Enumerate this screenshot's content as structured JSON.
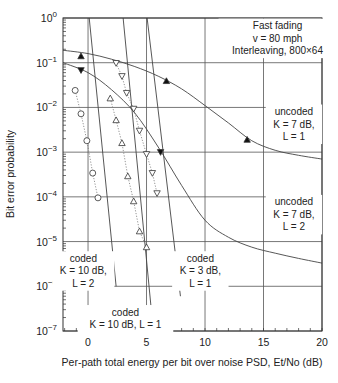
{
  "chart_data": {
    "type": "line",
    "title": "",
    "xlabel": "Per-path total energy per bit over noise PSD, Et/No (dB)",
    "ylabel": "Bit error probability",
    "xlim": [
      -2.14,
      20
    ],
    "ylim": [
      1e-07,
      1
    ],
    "yscale": "log",
    "grid": true,
    "x_ticks": [
      0,
      5,
      10,
      15,
      20
    ],
    "x_tick_labels": [
      "0",
      "5",
      "10",
      "15",
      "20"
    ],
    "y_ticks": [
      1,
      0.1,
      0.01,
      0.001,
      0.0001,
      1e-05,
      1e-06,
      1e-07
    ],
    "y_tick_labels": [
      {
        "base": "10",
        "exp": "0"
      },
      {
        "base": "10",
        "exp": "−1"
      },
      {
        "base": "10",
        "exp": "−2"
      },
      {
        "base": "10",
        "exp": "−3"
      },
      {
        "base": "10",
        "exp": "−4"
      },
      {
        "base": "10",
        "exp": "−5"
      },
      {
        "base": "10",
        "exp": "−6"
      },
      {
        "base": "10",
        "exp": "−7"
      }
    ],
    "annotations": [
      {
        "lines": [
          "Fast fading",
          "v = 80 mph",
          "Interleaving, 800×64"
        ],
        "x": 16.2,
        "y": 0.35
      },
      {
        "lines": [
          "uncoded",
          "K = 7 dB,",
          "L = 1"
        ],
        "x": 17.6,
        "y": 0.0042
      },
      {
        "lines": [
          "uncoded",
          "K = 7 dB,",
          "L = 2"
        ],
        "x": 17.6,
        "y": 4e-05
      },
      {
        "lines": [
          "coded",
          "K = 10 dB,",
          "L = 2"
        ],
        "x": -0.4,
        "y": 2.2e-06
      },
      {
        "lines": [
          "coded",
          "K = 10 dB, L = 1"
        ],
        "x": 3.2,
        "y": 1.9e-07
      },
      {
        "lines": [
          "coded",
          "K = 3 dB,",
          "L = 1"
        ],
        "x": 9.6,
        "y": 2.2e-06
      }
    ],
    "series": [
      {
        "name": "uncoded K = 7 dB, L = 1 (theory)",
        "style": "solid",
        "x": [
          -2.14,
          0,
          2,
          4,
          6,
          8,
          10,
          12,
          14,
          16,
          18,
          20
        ],
        "values": [
          0.19,
          0.16,
          0.12,
          0.082,
          0.05,
          0.026,
          0.011,
          0.0045,
          0.0018,
          0.0011,
          0.00085,
          0.0007
        ]
      },
      {
        "name": "uncoded K = 7 dB, L = 1 (simulation)",
        "style": "markers",
        "marker": "triangle-up-filled",
        "x": [
          -0.6,
          6.7,
          13.6
        ],
        "values": [
          0.14,
          0.039,
          0.0019
        ]
      },
      {
        "name": "uncoded K = 7 dB, L = 2 (theory)",
        "style": "solid",
        "x": [
          -2.14,
          0,
          2,
          4,
          6,
          8,
          10,
          12,
          14,
          16,
          18,
          20
        ],
        "values": [
          0.1,
          0.06,
          0.025,
          0.0075,
          0.0013,
          0.00018,
          3e-05,
          1.25e-05,
          7.5e-06,
          5.5e-06,
          4.2e-06,
          3.3e-06
        ]
      },
      {
        "name": "uncoded K = 7 dB, L = 2 (simulation)",
        "style": "markers",
        "marker": "triangle-down-filled",
        "x": [
          -0.6,
          6.2
        ],
        "values": [
          0.068,
          0.001
        ]
      },
      {
        "name": "coded K = 10 dB, L = 2 (theory)",
        "style": "solid",
        "x": [
          0.1,
          2.4
        ],
        "values": [
          1,
          1e-06
        ]
      },
      {
        "name": "coded K = 10 dB, L = 2 (simulation)",
        "style": "dotted-markers",
        "marker": "circle-open",
        "x": [
          -1.1,
          -0.6,
          -0.1,
          0.4,
          0.85
        ],
        "values": [
          0.024,
          0.0072,
          0.0018,
          0.00034,
          9.5e-05
        ]
      },
      {
        "name": "coded K = 10 dB, L = 1 (theory)",
        "style": "solid",
        "x": [
          3.0,
          5.5
        ],
        "values": [
          1,
          1.7e-07
        ]
      },
      {
        "name": "coded K = 10 dB, L = 1 (simulation)",
        "style": "dotted-markers",
        "marker": "triangle-up-open",
        "x": [
          1.9,
          2.4,
          2.9,
          3.4,
          3.9,
          4.4,
          5.0
        ],
        "values": [
          0.016,
          0.0052,
          0.0016,
          0.00029,
          8e-05,
          1.7e-05,
          7.5e-06
        ]
      },
      {
        "name": "coded K = 3 dB, L = 1 (theory)",
        "style": "solid",
        "x": [
          5.05,
          7.9
        ],
        "values": [
          1,
          6e-07
        ]
      },
      {
        "name": "coded K = 3 dB, L = 1 (simulation)",
        "style": "dotted-markers",
        "marker": "triangle-down-open",
        "x": [
          2.4,
          2.9,
          3.3,
          3.9,
          4.4,
          5.0,
          5.5,
          5.9
        ],
        "values": [
          0.098,
          0.05,
          0.021,
          0.0093,
          0.003,
          0.0009,
          0.00034,
          0.00012
        ]
      }
    ]
  }
}
